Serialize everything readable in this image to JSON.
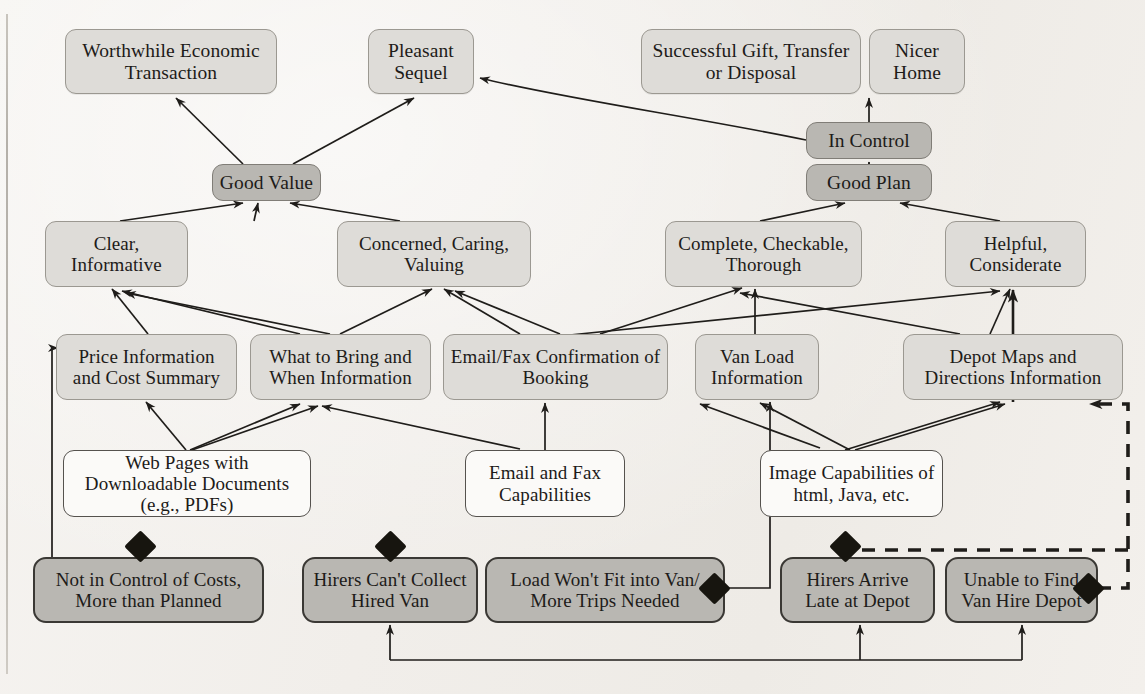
{
  "diagram": {
    "colors": {
      "goal_fill": "#dedcd8",
      "core_fill": "#b9b7b2",
      "plain_fill": "#fbfaf8",
      "obstacle_fill": "#b9b7b2",
      "edge": "#1f1d1a",
      "diamond": "#17150f",
      "page_bg": "#f4f2ef"
    },
    "nodes": [
      {
        "id": "worthwhile",
        "label": "Worthwhile Economic Transaction",
        "kind": "goal",
        "x": 65,
        "y": 29,
        "w": 212,
        "h": 65
      },
      {
        "id": "pleasant",
        "label": "Pleasant Sequel",
        "kind": "goal",
        "x": 368,
        "y": 29,
        "w": 106,
        "h": 65
      },
      {
        "id": "successful",
        "label": "Successful Gift, Transfer or Disposal",
        "kind": "goal",
        "x": 641,
        "y": 29,
        "w": 220,
        "h": 65
      },
      {
        "id": "nicer",
        "label": "Nicer Home",
        "kind": "goal",
        "x": 869,
        "y": 29,
        "w": 96,
        "h": 65
      },
      {
        "id": "goodvalue",
        "label": "Good Value",
        "kind": "core",
        "x": 212,
        "y": 164,
        "w": 109,
        "h": 37
      },
      {
        "id": "incontrol",
        "label": "In Control",
        "kind": "core",
        "x": 806,
        "y": 122,
        "w": 126,
        "h": 37
      },
      {
        "id": "goodplan",
        "label": "Good Plan",
        "kind": "core",
        "x": 806,
        "y": 164,
        "w": 126,
        "h": 37
      },
      {
        "id": "clear",
        "label": "Clear, Informative",
        "kind": "attr",
        "x": 45,
        "y": 221,
        "w": 143,
        "h": 66
      },
      {
        "id": "concerned",
        "label": "Concerned, Caring, Valuing",
        "kind": "attr",
        "x": 337,
        "y": 221,
        "w": 194,
        "h": 66
      },
      {
        "id": "complete",
        "label": "Complete, Checkable, Thorough",
        "kind": "attr",
        "x": 665,
        "y": 221,
        "w": 197,
        "h": 66
      },
      {
        "id": "helpful",
        "label": "Helpful, Considerate",
        "kind": "attr",
        "x": 945,
        "y": 221,
        "w": 141,
        "h": 66
      },
      {
        "id": "price",
        "label": "Price Information and Cost Summary",
        "kind": "attr",
        "x": 56,
        "y": 334,
        "w": 181,
        "h": 66
      },
      {
        "id": "whattobring",
        "label": "What to Bring and When Information",
        "kind": "attr",
        "x": 250,
        "y": 334,
        "w": 181,
        "h": 66
      },
      {
        "id": "emailfax",
        "label": "Email/Fax Confirmation of Booking",
        "kind": "attr",
        "x": 443,
        "y": 334,
        "w": 225,
        "h": 66
      },
      {
        "id": "vanload",
        "label": "Van Load Information",
        "kind": "attr",
        "x": 695,
        "y": 334,
        "w": 124,
        "h": 66
      },
      {
        "id": "depotmaps",
        "label": "Depot Maps and Directions Information",
        "kind": "attr",
        "x": 903,
        "y": 334,
        "w": 220,
        "h": 66
      },
      {
        "id": "webpages",
        "label": "Web Pages with Downloadable Documents (e.g., PDFs)",
        "kind": "plain",
        "x": 63,
        "y": 450,
        "w": 248,
        "h": 67
      },
      {
        "id": "emailcap",
        "label": "Email and Fax Capabilities",
        "kind": "plain",
        "x": 465,
        "y": 450,
        "w": 160,
        "h": 67
      },
      {
        "id": "imagecap",
        "label": "Image Capabilities of html, Java, etc.",
        "kind": "plain",
        "x": 760,
        "y": 450,
        "w": 183,
        "h": 67
      },
      {
        "id": "notincontrol",
        "label": "Not in Control of Costs, More than Planned",
        "kind": "obstacle",
        "x": 33,
        "y": 557,
        "w": 231,
        "h": 66
      },
      {
        "id": "hirerscant",
        "label": "Hirers Can't Collect Hired Van",
        "kind": "obstacle",
        "x": 302,
        "y": 557,
        "w": 176,
        "h": 66
      },
      {
        "id": "loadwont",
        "label": "Load Won't Fit into Van/ More Trips Needed",
        "kind": "obstacle",
        "x": 485,
        "y": 557,
        "w": 240,
        "h": 66
      },
      {
        "id": "hirersarrive",
        "label": "Hirers Arrive Late at Depot",
        "kind": "obstacle",
        "x": 780,
        "y": 557,
        "w": 155,
        "h": 66
      },
      {
        "id": "unabletofind",
        "label": "Unable to Find Van Hire Depot",
        "kind": "obstacle",
        "x": 945,
        "y": 557,
        "w": 153,
        "h": 66
      }
    ],
    "obstacle_markers": [
      {
        "id": "marker-not-in-control",
        "x": 140,
        "y": 546
      },
      {
        "id": "marker-hirers-cant",
        "x": 390,
        "y": 546
      },
      {
        "id": "marker-load-wont",
        "x": 714,
        "y": 588
      },
      {
        "id": "marker-hirers-arrive",
        "x": 845,
        "y": 546
      },
      {
        "id": "marker-unable-to-find",
        "x": 1088,
        "y": 588
      }
    ],
    "edges": [
      {
        "from": "goodvalue",
        "to": "worthwhile",
        "style": "solid"
      },
      {
        "from": "goodvalue",
        "to": "pleasant",
        "style": "solid"
      },
      {
        "from": "incontrol",
        "to": "successful",
        "style": "solid"
      },
      {
        "from": "incontrol",
        "to": "pleasant",
        "style": "solid"
      },
      {
        "from": "goodplan",
        "to": "incontrol",
        "style": "solid"
      },
      {
        "from": "clear",
        "to": "goodvalue",
        "style": "solid"
      },
      {
        "from": "concerned",
        "to": "goodvalue",
        "style": "solid"
      },
      {
        "from": "complete",
        "to": "goodplan",
        "style": "solid"
      },
      {
        "from": "helpful",
        "to": "goodplan",
        "style": "solid"
      },
      {
        "from": "price",
        "to": "clear",
        "style": "solid"
      },
      {
        "from": "whattobring",
        "to": "clear",
        "style": "solid"
      },
      {
        "from": "whattobring",
        "to": "concerned",
        "style": "solid"
      },
      {
        "from": "emailfax",
        "to": "concerned",
        "style": "solid"
      },
      {
        "from": "emailfax",
        "to": "complete",
        "style": "solid"
      },
      {
        "from": "vanload",
        "to": "complete",
        "style": "solid"
      },
      {
        "from": "depotmaps",
        "to": "helpful",
        "style": "solid"
      },
      {
        "from": "depotmaps",
        "to": "complete",
        "style": "solid"
      },
      {
        "from": "webpages",
        "to": "price",
        "style": "solid"
      },
      {
        "from": "webpages",
        "to": "whattobring",
        "style": "solid"
      },
      {
        "from": "emailcap",
        "to": "emailfax",
        "style": "solid"
      },
      {
        "from": "imagecap",
        "to": "vanload",
        "style": "solid"
      },
      {
        "from": "imagecap",
        "to": "depotmaps",
        "style": "solid"
      },
      {
        "from": "loadwont",
        "to": "vanload",
        "style": "orthogonal"
      },
      {
        "from": "notincontrol",
        "to": "price",
        "style": "orthogonal"
      },
      {
        "from": "unabletofind",
        "to": "depotmaps",
        "style": "dashed"
      },
      {
        "from": "bottom-rail",
        "to": "hirerscant",
        "style": "orthogonal"
      },
      {
        "from": "bottom-rail",
        "to": "hirersarrive",
        "style": "orthogonal"
      },
      {
        "from": "bottom-rail",
        "to": "unabletofind",
        "style": "orthogonal"
      }
    ]
  }
}
